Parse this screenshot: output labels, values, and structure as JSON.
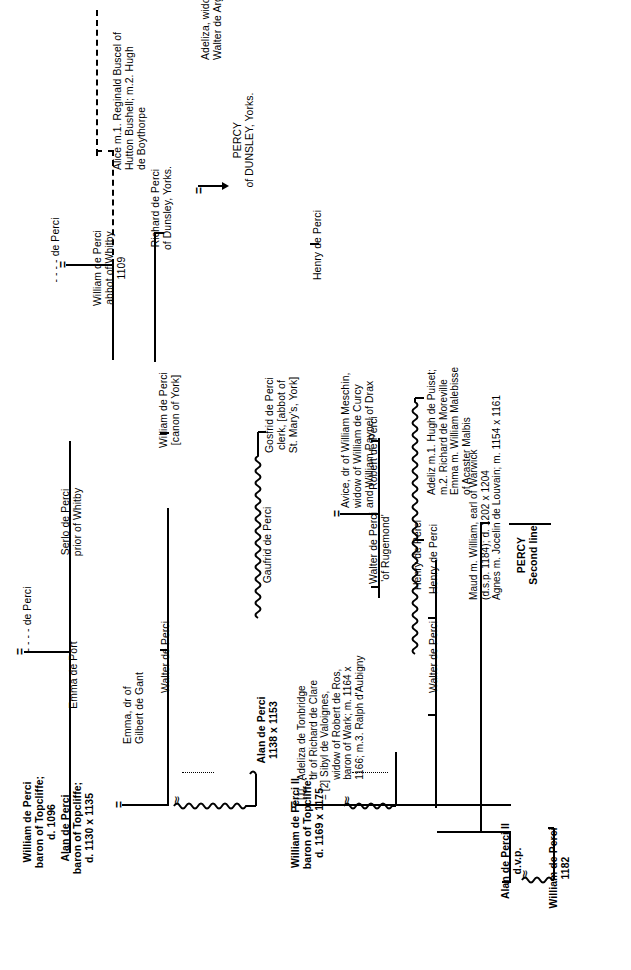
{
  "title": "PERCY Second line",
  "meta": {
    "orientation": "text rotated 90 degrees counter-clockwise",
    "ink_color": "#000000",
    "paper_color": "#ffffff"
  },
  "nodes": {
    "root_de_perci": "- - - - de Perci",
    "emma_de_port": "Emma de Port",
    "de_perci_2": "- - - - de Perci",
    "william_topcliffe": "William de Perci\nbaron of Topcliffe;\nd. 1096",
    "serlo": "Serlo de Perci\nprior of Whitby",
    "william_abbot": "William de Perci\nabbot of Whitby\n1109",
    "alice": "Alice m.1. Reginald Buscel of\nHutton Bushell; m.2. Hugh\nde Boythorpe",
    "richard_dunsley": "Richard de Perci\nof Dunsley, Yorks.",
    "adeliza_argentom": "Adeliza, widow of\nWalter de Argentom",
    "percy_dunsley": "PERCY\nof DUNSLEY, Yorks.",
    "alan_topcliffe": "Alan de Perci\nbaron of Topcliffe;\nd. 1130 x 1135",
    "emma_gant": "Emma, dr of\nGilbert de Gant",
    "walter_1": "Walter de Perci",
    "william_canon": "William de Perci\n[canon of York]",
    "henry_1": "Henry de Perci",
    "alan_1138": "Alan de Perci\n1138 x 1153",
    "gaufrid": "Gaufrid de Perci",
    "gosfrid": "Gosfrid de Perci\nclerk, [abbot of\nSt. Mary's, York]",
    "william_ii_topcliffe": "William de Perci II\nbaron of Topcliffe;\nd. 1169 x 1175",
    "wives_william_ii": "[1]   Adeliza de Tonbridge\n       dr of Richard de Clare\n= [2] Sibyl de Valoignes,\n       widow of Robert de Ros,\n       baron of Wark; m. 1164 x\n       1166; m.3. Ralph d'Aubigny",
    "walter_rugemond": "Walter de Perci\n'of Rugemond'",
    "avice": "Avice, dr of William Meschin,\nwidow of William de Curcy\nand William Paynel of Drax",
    "walter_2": "Walter de Perci",
    "robert": "Robert de Perci",
    "henry_2": "Henry de Perci",
    "henry_3": "Henry de Perci",
    "adeliz_emma": "Adeliz m.1. Hugh de Puiset;\nm.2. Richard de Moreville\nEmma m. William Malebisse\nof Acaster Malbis",
    "maud_agnes": "Maud m. William, earl of Warwick\n(d.s.p. 1184); d. 1202 x 1204\nAgnes m. Jocelin de Louvain; m. 1154 x 1161",
    "alan_ii": "Alan de Perci II\nd.v.p.",
    "william_1182": "William de Perci\n1182",
    "percy_second_line": "PERCY\nSecond line"
  },
  "marriage_symbol": "=",
  "approx_symbol": "≈",
  "genealogy": {
    "type": "family-tree",
    "root": "- - - - de Perci = Emma de Port",
    "generations": [
      {
        "level": 1,
        "people": [
          "- - - - de Perci",
          "Emma de Port"
        ]
      },
      {
        "level": 2,
        "people": [
          "William de Perci, baron of Topcliffe; d. 1096 = - - - - de Perci",
          "Serlo de Perci, prior of Whitby"
        ]
      },
      {
        "level": 3,
        "people": [
          "Alan de Perci, baron of Topcliffe; d. 1130 x 1135 = Emma, dr of Gilbert de Gant",
          "Walter de Perci",
          "William de Perci, abbot of Whitby 1109",
          "Alice m.1. Reginald Buscel of Hutton Bushell; m.2. Hugh de Boythorpe"
        ]
      },
      {
        "level": 4,
        "people": [
          "William de Perci II, baron of Topcliffe; d. 1169 x 1175",
          "Walter de Perci",
          "William de Perci [canon of York]",
          "Henry de Perci",
          "Alan de Perci 1138 x 1153",
          "Richard de Perci of Dunsley, Yorks. = Adeliza, widow of Walter de Argentom"
        ]
      },
      {
        "level": 5,
        "people": [
          "Walter de Perci 'of Rugemond' = Avice, dr of William Meschin",
          "Gaufrid de Perci",
          "Walter de Perci",
          "Henry de Perci",
          "Maud m. William, earl of Warwick",
          "Agnes m. Jocelin de Louvain",
          "Alan de Perci II d.v.p."
        ]
      },
      {
        "level": 6,
        "people": [
          "Robert de Perci",
          "Gosfrid de Perci, clerk, [abbot of St. Mary's, York]",
          "Henry de Perci",
          "Adeliz m.1. Hugh de Puiset",
          "Emma m. William Malebisse",
          "William de Perci 1182"
        ]
      }
    ]
  }
}
